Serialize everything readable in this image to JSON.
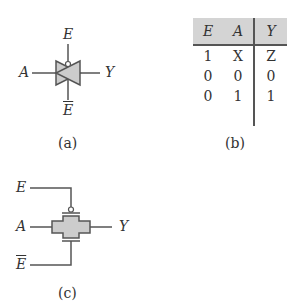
{
  "figure_a": {
    "labels": {
      "top": "E",
      "left": "A",
      "right": "Y",
      "bottom": "E"
    },
    "caption": "(a)"
  },
  "figure_b": {
    "headers": [
      "E",
      "A",
      "Y"
    ],
    "rows": [
      [
        "1",
        "X",
        "Z"
      ],
      [
        "0",
        "0",
        "0"
      ],
      [
        "0",
        "1",
        "1"
      ]
    ],
    "caption": "(b)"
  },
  "figure_c": {
    "labels": {
      "top": "E",
      "left": "A",
      "right": "Y",
      "bottom": "E"
    },
    "caption": "(c)"
  }
}
